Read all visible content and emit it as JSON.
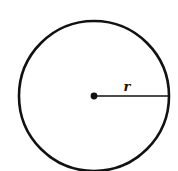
{
  "diagram": {
    "type": "circle-with-radius",
    "radius_label": "r",
    "stroke_color": "#111111",
    "background": "#ffffff",
    "circle": {
      "cx": 94,
      "cy": 96,
      "r": 75
    },
    "center_point": {
      "cx": 94,
      "cy": 96,
      "r": 3.2
    },
    "radius_line": {
      "x1": 94,
      "y1": 96,
      "x2": 169,
      "y2": 96
    }
  }
}
